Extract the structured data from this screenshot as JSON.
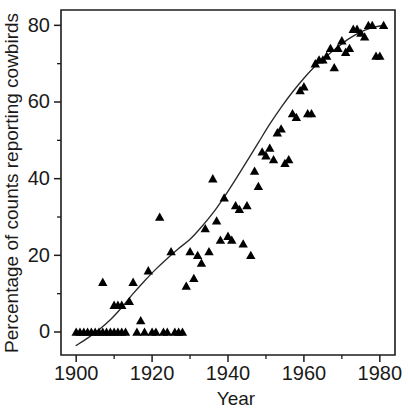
{
  "chart_data": {
    "type": "scatter",
    "title": "",
    "xlabel": "Year",
    "ylabel": "Percentage of counts reporting cowbirds",
    "xlim": [
      1896,
      1984
    ],
    "ylim": [
      -6,
      84
    ],
    "grid": false,
    "legend": null,
    "marker": "filled-triangle",
    "marker_color": "#000000",
    "curve_color": "#2a2a2a",
    "x_ticks_major": [
      1900,
      1920,
      1940,
      1960,
      1980
    ],
    "x_ticks_minor": [
      1910,
      1930,
      1950,
      1970
    ],
    "y_ticks_major": [
      0,
      20,
      40,
      60,
      80
    ],
    "y_ticks_minor": [
      10,
      30,
      50,
      70
    ],
    "x_tick_labels": [
      "1900",
      "1920",
      "1940",
      "1960",
      "1980"
    ],
    "y_tick_labels": [
      "0",
      "20",
      "40",
      "60",
      "80"
    ],
    "series": [
      {
        "name": "Percentage of counts reporting cowbirds",
        "points": [
          [
            1900,
            0
          ],
          [
            1901,
            0
          ],
          [
            1902,
            0
          ],
          [
            1903,
            0
          ],
          [
            1904,
            0
          ],
          [
            1905,
            0
          ],
          [
            1906,
            0
          ],
          [
            1907,
            0
          ],
          [
            1907,
            13
          ],
          [
            1908,
            0
          ],
          [
            1909,
            0
          ],
          [
            1910,
            0
          ],
          [
            1910,
            7
          ],
          [
            1911,
            7
          ],
          [
            1911,
            0
          ],
          [
            1912,
            7
          ],
          [
            1912,
            0
          ],
          [
            1913,
            0
          ],
          [
            1914,
            8
          ],
          [
            1915,
            13
          ],
          [
            1916,
            0
          ],
          [
            1917,
            3
          ],
          [
            1918,
            0
          ],
          [
            1919,
            16
          ],
          [
            1920,
            0
          ],
          [
            1921,
            0
          ],
          [
            1922,
            30
          ],
          [
            1923,
            0
          ],
          [
            1924,
            0
          ],
          [
            1925,
            21
          ],
          [
            1926,
            0
          ],
          [
            1927,
            0
          ],
          [
            1928,
            0
          ],
          [
            1929,
            12
          ],
          [
            1930,
            21
          ],
          [
            1931,
            14
          ],
          [
            1932,
            20
          ],
          [
            1933,
            18
          ],
          [
            1934,
            27
          ],
          [
            1935,
            21
          ],
          [
            1936,
            40
          ],
          [
            1937,
            29
          ],
          [
            1938,
            24
          ],
          [
            1939,
            35
          ],
          [
            1940,
            25
          ],
          [
            1941,
            24
          ],
          [
            1942,
            33
          ],
          [
            1943,
            32
          ],
          [
            1944,
            23
          ],
          [
            1945,
            33
          ],
          [
            1946,
            20
          ],
          [
            1947,
            42
          ],
          [
            1948,
            38
          ],
          [
            1949,
            47
          ],
          [
            1950,
            46
          ],
          [
            1951,
            48
          ],
          [
            1952,
            45
          ],
          [
            1953,
            52
          ],
          [
            1954,
            53
          ],
          [
            1955,
            44
          ],
          [
            1956,
            45
          ],
          [
            1957,
            57
          ],
          [
            1958,
            56
          ],
          [
            1959,
            63
          ],
          [
            1960,
            64
          ],
          [
            1961,
            57
          ],
          [
            1962,
            57
          ],
          [
            1963,
            70
          ],
          [
            1964,
            71
          ],
          [
            1965,
            71
          ],
          [
            1966,
            72
          ],
          [
            1967,
            74
          ],
          [
            1968,
            69
          ],
          [
            1969,
            74
          ],
          [
            1970,
            76
          ],
          [
            1971,
            73
          ],
          [
            1972,
            74
          ],
          [
            1973,
            79
          ],
          [
            1974,
            79
          ],
          [
            1975,
            78
          ],
          [
            1976,
            77
          ],
          [
            1977,
            80
          ],
          [
            1978,
            80
          ],
          [
            1979,
            72
          ],
          [
            1980,
            72
          ],
          [
            1981,
            80
          ]
        ]
      }
    ],
    "fit_curve": {
      "name": "fitted logistic trend",
      "points": [
        [
          1900,
          -3.5
        ],
        [
          1903,
          -1.6
        ],
        [
          1906,
          0.6
        ],
        [
          1909,
          3.2
        ],
        [
          1912,
          6.4
        ],
        [
          1915,
          10.0
        ],
        [
          1918,
          13.3
        ],
        [
          1921,
          16.4
        ],
        [
          1924,
          19.2
        ],
        [
          1927,
          21.8
        ],
        [
          1930,
          24.2
        ],
        [
          1933,
          27.4
        ],
        [
          1936,
          31.0
        ],
        [
          1939,
          35.2
        ],
        [
          1942,
          39.8
        ],
        [
          1945,
          44.6
        ],
        [
          1948,
          49.4
        ],
        [
          1951,
          54.2
        ],
        [
          1954,
          58.6
        ],
        [
          1957,
          62.6
        ],
        [
          1960,
          66.2
        ],
        [
          1963,
          69.4
        ],
        [
          1966,
          72.0
        ],
        [
          1969,
          74.4
        ],
        [
          1972,
          76.6
        ],
        [
          1975,
          78.3
        ],
        [
          1978,
          79.4
        ],
        [
          1981,
          80.0
        ]
      ]
    }
  }
}
